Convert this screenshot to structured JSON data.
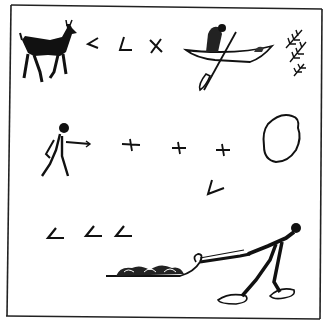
{
  "figure": {
    "description": "Pictographic drawing inside a rectangular border",
    "colors": {
      "ink": "#111111",
      "paper": "#ffffff"
    },
    "rows": [
      {
        "name": "row-1",
        "glyphs": [
          "deer",
          "angle-mark",
          "angle-mark",
          "x-mark",
          "person-in-canoe",
          "fir-branches"
        ]
      },
      {
        "name": "row-2",
        "glyphs": [
          "pointing-person",
          "cross-mark",
          "cross-mark",
          "cross-mark",
          "lake-outline",
          "angle-mark"
        ]
      },
      {
        "name": "row-3",
        "glyphs": [
          "angle-mark",
          "angle-mark",
          "angle-mark",
          "loaded-toboggan",
          "snowshoer-pulling"
        ]
      }
    ]
  }
}
